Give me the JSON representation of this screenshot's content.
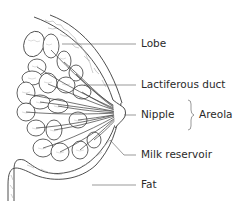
{
  "diagram": {
    "labels": [
      {
        "id": "lobe",
        "text": "Lobe"
      },
      {
        "id": "lactiferous_duct",
        "text": "Lactiferous duct"
      },
      {
        "id": "nipple",
        "text": "Nipple"
      },
      {
        "id": "areola",
        "text": "Areola"
      },
      {
        "id": "milk_reservoir",
        "text": "Milk reservoir"
      },
      {
        "id": "fat",
        "text": "Fat"
      }
    ],
    "colors": {
      "line": "#3a3a3a",
      "fill": "#ffffff",
      "texture": "#9a9a9a",
      "text": "#2a2a2a"
    }
  }
}
